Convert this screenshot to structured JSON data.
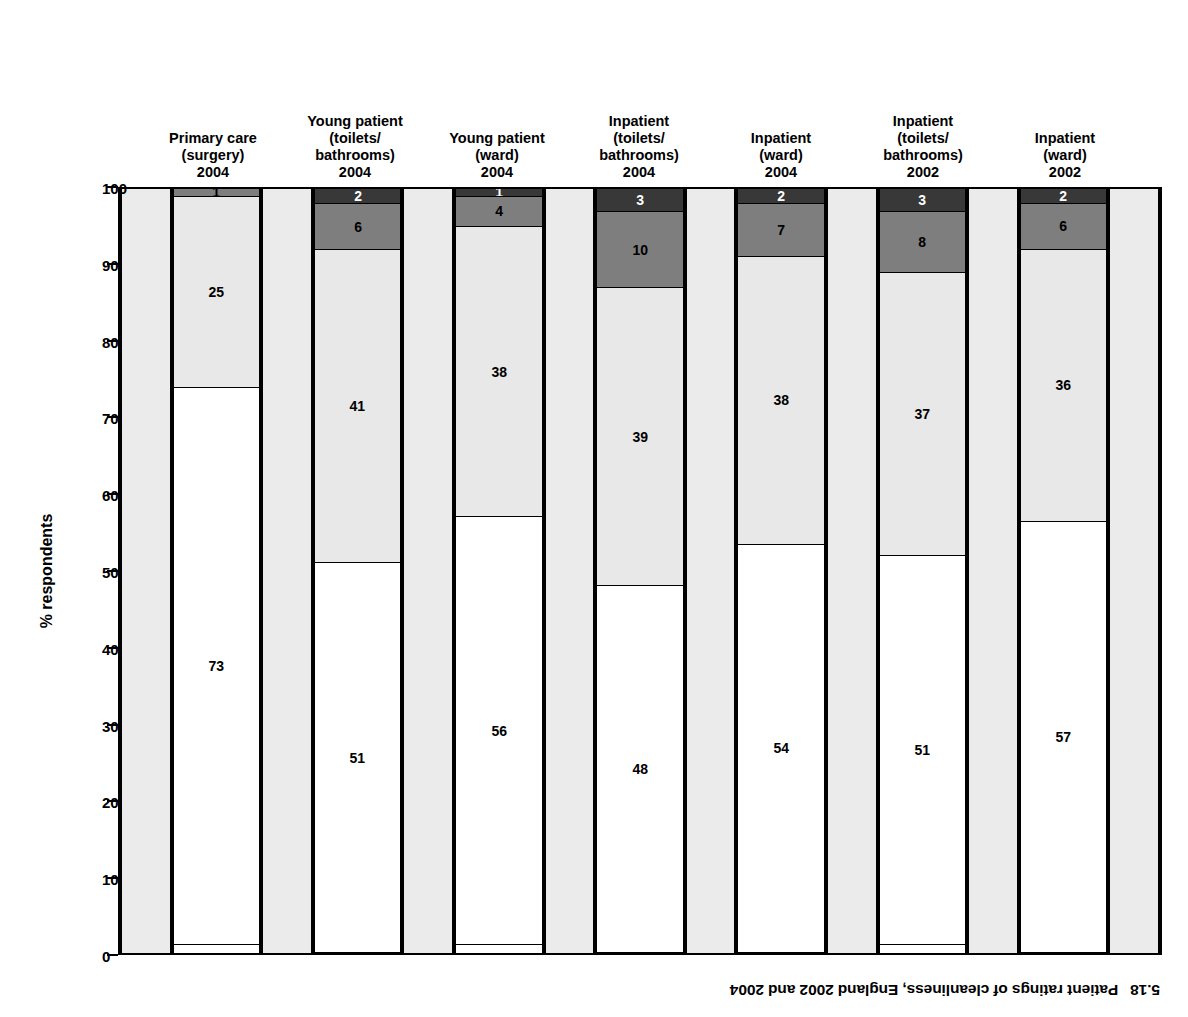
{
  "caption": {
    "number": "5.18",
    "text": "Patient ratings of cleanliness, England 2002 and 2004"
  },
  "axis": {
    "y_title": "% respondents",
    "y_min": 0,
    "y_max": 100,
    "y_step": 10,
    "y_ticks": [
      "0",
      "10",
      "20",
      "30",
      "40",
      "50",
      "60",
      "70",
      "80",
      "90",
      "100"
    ]
  },
  "colors": {
    "very_clean": "#ffffff",
    "fairly_clean": "#e8e8e8",
    "not_very_clean": "#7e7e7e",
    "not_at_all_clean": "#383838",
    "gap_band": "#ebebeb",
    "outline": "#000000"
  },
  "chart_data": {
    "type": "bar",
    "subtitle": "",
    "xlabel": "",
    "ylabel": "% respondents",
    "ylim": [
      0,
      100
    ],
    "grid": false,
    "legend": "none",
    "stacked": true,
    "orientation": "vertical-stacked-inverted",
    "categories": [
      "Inpatient (ward) 2002",
      "Inpatient (toilets/bathrooms) 2002",
      "Inpatient (ward) 2004",
      "Inpatient (toilets/bathrooms) 2004",
      "Young patient (ward) 2004",
      "Young patient (toilets/bathrooms) 2004",
      "Primary care (surgery) 2004"
    ],
    "series": [
      {
        "name": "Very clean",
        "values": [
          57,
          51,
          54,
          48,
          56,
          51,
          73
        ]
      },
      {
        "name": "Fairly clean",
        "values": [
          36,
          37,
          38,
          39,
          38,
          41,
          25
        ]
      },
      {
        "name": "Not very clean",
        "values": [
          6,
          8,
          7,
          10,
          4,
          6,
          1
        ]
      },
      {
        "name": "Not at all clean",
        "values": [
          2,
          3,
          2,
          3,
          1,
          2,
          0
        ]
      }
    ]
  },
  "bars": [
    {
      "key": "inpatient-ward-2002",
      "label_lines": [
        "Inpatient",
        "(ward)",
        "2002"
      ],
      "segments": [
        {
          "name": "not-at-all-clean",
          "value": 2,
          "label": "2"
        },
        {
          "name": "not-very-clean",
          "value": 6,
          "label": "6"
        },
        {
          "name": "fairly-clean",
          "value": 36,
          "label": "36"
        },
        {
          "name": "very-clean",
          "value": 57,
          "label": "57"
        }
      ]
    },
    {
      "key": "inpatient-toilets-2002",
      "label_lines": [
        "Inpatient",
        "(toilets/",
        "bathrooms)",
        "2002"
      ],
      "segments": [
        {
          "name": "not-at-all-clean",
          "value": 3,
          "label": "3"
        },
        {
          "name": "not-very-clean",
          "value": 8,
          "label": "8"
        },
        {
          "name": "fairly-clean",
          "value": 37,
          "label": "37"
        },
        {
          "name": "very-clean",
          "value": 51,
          "label": "51"
        }
      ]
    },
    {
      "key": "inpatient-ward-2004",
      "label_lines": [
        "Inpatient",
        "(ward)",
        "2004"
      ],
      "segments": [
        {
          "name": "not-at-all-clean",
          "value": 2,
          "label": "2"
        },
        {
          "name": "not-very-clean",
          "value": 7,
          "label": "7"
        },
        {
          "name": "fairly-clean",
          "value": 38,
          "label": "38"
        },
        {
          "name": "very-clean",
          "value": 54,
          "label": "54"
        }
      ]
    },
    {
      "key": "inpatient-toilets-2004",
      "label_lines": [
        "Inpatient",
        "(toilets/",
        "bathrooms)",
        "2004"
      ],
      "segments": [
        {
          "name": "not-at-all-clean",
          "value": 3,
          "label": "3"
        },
        {
          "name": "not-very-clean",
          "value": 10,
          "label": "10"
        },
        {
          "name": "fairly-clean",
          "value": 39,
          "label": "39"
        },
        {
          "name": "very-clean",
          "value": 48,
          "label": "48"
        }
      ]
    },
    {
      "key": "young-patient-ward-2004",
      "label_lines": [
        "Young patient",
        "(ward)",
        "2004"
      ],
      "segments": [
        {
          "name": "not-at-all-clean",
          "value": 1,
          "label": "1"
        },
        {
          "name": "not-very-clean",
          "value": 4,
          "label": "4"
        },
        {
          "name": "fairly-clean",
          "value": 38,
          "label": "38"
        },
        {
          "name": "very-clean",
          "value": 56,
          "label": "56"
        }
      ]
    },
    {
      "key": "young-patient-toilets-2004",
      "label_lines": [
        "Young patient",
        "(toilets/",
        "bathrooms)",
        "2004"
      ],
      "segments": [
        {
          "name": "not-at-all-clean",
          "value": 2,
          "label": "2"
        },
        {
          "name": "not-very-clean",
          "value": 6,
          "label": "6"
        },
        {
          "name": "fairly-clean",
          "value": 41,
          "label": "41"
        },
        {
          "name": "very-clean",
          "value": 51,
          "label": "51"
        }
      ]
    },
    {
      "key": "primary-care-surgery-2004",
      "label_lines": [
        "Primary care",
        "(surgery)",
        "2004"
      ],
      "segments": [
        {
          "name": "not-at-all-clean",
          "value": 0,
          "label": ""
        },
        {
          "name": "not-very-clean",
          "value": 1,
          "label": "1"
        },
        {
          "name": "fairly-clean",
          "value": 25,
          "label": "25"
        },
        {
          "name": "very-clean",
          "value": 73,
          "label": "73"
        }
      ]
    }
  ]
}
